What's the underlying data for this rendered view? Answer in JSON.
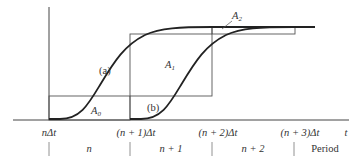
{
  "diagram": {
    "type": "time-step response curves",
    "curves": [
      {
        "id": "a",
        "label": "(a)"
      },
      {
        "id": "b",
        "label": "(b)"
      }
    ],
    "areas": [
      {
        "id": "A0",
        "label": "A",
        "sub": "0"
      },
      {
        "id": "A1",
        "label": "A",
        "sub": "1"
      },
      {
        "id": "A2",
        "label": "A",
        "sub": "2"
      }
    ],
    "axis": {
      "x_label": "t",
      "ticks": [
        "nΔt",
        "(n + 1)Δt",
        "(n + 2)Δt",
        "(n + 3)Δt"
      ]
    },
    "periods": {
      "items": [
        "n",
        "n + 1",
        "n + 2"
      ],
      "caption": "Period"
    },
    "colors": {
      "line": "#222222",
      "box": "#555555"
    }
  }
}
